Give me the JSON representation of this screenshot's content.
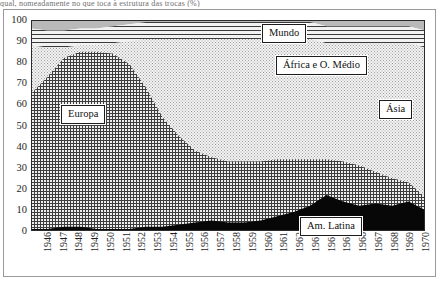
{
  "figure": {
    "caption_sliver": "qual, nomeadamente no que toca à estrutura das trocas                      (%)",
    "background_color": "#ffffff",
    "frame_color": "#9a9a9a"
  },
  "axes": {
    "y": {
      "label": "",
      "min": 0,
      "max": 100,
      "step": 10,
      "ticks": [
        "100",
        "90",
        "80",
        "70",
        "60",
        "50",
        "40",
        "30",
        "20",
        "10",
        "0"
      ]
    },
    "x": {
      "label": "",
      "ticks": [
        "1946",
        "1947",
        "1948",
        "1949",
        "1950",
        "1951",
        "1952",
        "1953",
        "1954",
        "1955",
        "1956",
        "1957",
        "1958",
        "1959",
        "1960",
        "1961",
        "1962",
        "1963",
        "1964",
        "1965",
        "1966",
        "1967",
        "1968",
        "1969",
        "1970"
      ]
    }
  },
  "callouts": [
    {
      "key": "mundo",
      "label": "Mundo"
    },
    {
      "key": "africa",
      "label": "África e O. Médio"
    },
    {
      "key": "europa",
      "label": "Europa"
    },
    {
      "key": "asia",
      "label": "Ásia"
    },
    {
      "key": "latina",
      "label": "Am. Latina"
    }
  ],
  "chart_data": {
    "type": "area",
    "stacked": true,
    "title": "",
    "subtitle": "",
    "xlabel": "",
    "ylabel": "",
    "ylim": [
      0,
      100
    ],
    "xlim": [
      "1946",
      "1970"
    ],
    "grid": false,
    "legend": "in-plot callout boxes",
    "units": "percent",
    "x": [
      "1946",
      "1947",
      "1948",
      "1949",
      "1950",
      "1951",
      "1952",
      "1953",
      "1954",
      "1955",
      "1956",
      "1957",
      "1958",
      "1959",
      "1960",
      "1961",
      "1962",
      "1963",
      "1964",
      "1965",
      "1966",
      "1967",
      "1968",
      "1969",
      "1970"
    ],
    "series": [
      {
        "name": "Am. Latina",
        "fill": "solid-black",
        "color": "#070707",
        "values": [
          1,
          1,
          2,
          2,
          1,
          1,
          1,
          2,
          2,
          3,
          4,
          5,
          4,
          4,
          5,
          7,
          9,
          12,
          17,
          14,
          12,
          13,
          12,
          14,
          10
        ]
      },
      {
        "name": "Europa",
        "fill": "cross-hatch",
        "color": "#3d3d3d",
        "values": [
          64,
          72,
          80,
          83,
          84,
          83,
          78,
          66,
          52,
          42,
          34,
          30,
          29,
          29,
          28,
          27,
          25,
          22,
          17,
          19,
          19,
          15,
          13,
          9,
          6
        ]
      },
      {
        "name": "Ásia",
        "fill": "light-stipple",
        "color": "#9d9d9d",
        "values": [
          23,
          14,
          5,
          3,
          3,
          5,
          11,
          23,
          37,
          46,
          53,
          56,
          58,
          58,
          58,
          57,
          57,
          57,
          55,
          56,
          58,
          61,
          64,
          66,
          71
        ]
      },
      {
        "name": "África e O. Médio",
        "fill": "horizontal-lines",
        "color": "#3a3a3a",
        "values": [
          0,
          0,
          0,
          0,
          0,
          0,
          0,
          0,
          0,
          0,
          0,
          0,
          0,
          0,
          0,
          0,
          0,
          0,
          0,
          0,
          0,
          0,
          0,
          0,
          0
        ]
      },
      {
        "name": "Mundo",
        "fill": "solid-grey",
        "color": "#b9b9b9",
        "values": [
          12,
          13,
          13,
          12,
          12,
          11,
          10,
          9,
          9,
          9,
          9,
          9,
          9,
          9,
          9,
          9,
          9,
          9,
          11,
          11,
          11,
          11,
          11,
          11,
          13
        ]
      }
    ]
  }
}
